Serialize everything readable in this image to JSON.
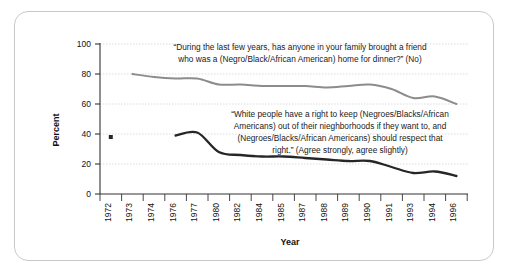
{
  "chart_data": {
    "type": "line",
    "title": "",
    "xlabel": "Year",
    "ylabel": "Percent",
    "ylim": [
      0,
      100
    ],
    "yticks": [
      0,
      20,
      40,
      60,
      80,
      100
    ],
    "grid": true,
    "legend_position": "none",
    "categories": [
      "1972",
      "1973",
      "1974",
      "1976",
      "1977",
      "1980",
      "1982",
      "1984",
      "1985",
      "1987",
      "1988",
      "1989",
      "1990",
      "1991",
      "1993",
      "1994",
      "1996"
    ],
    "series": [
      {
        "name": "During the last few years, has anyone in your family brought a friend who was a (Negro/Black/African American) home for dinner? (No)",
        "color": "#8c8c8c",
        "x": [
          "1973",
          "1974",
          "1976",
          "1977",
          "1980",
          "1982",
          "1984",
          "1985",
          "1987",
          "1988",
          "1989",
          "1990",
          "1991",
          "1993",
          "1994",
          "1996"
        ],
        "values": [
          80,
          78,
          77,
          77,
          73,
          73,
          72,
          72,
          72,
          71,
          72,
          73,
          70,
          64,
          65,
          60
        ]
      },
      {
        "name": "White people have a right to keep (Negroes/Blacks/African Americans) out of their nieghborhoods if they want to, and (Negroes/Blacks/African Americans) should respect that right. (Agree strongly, agree slightly)",
        "color": "#262626",
        "x": [
          "1976",
          "1977",
          "1980",
          "1982",
          "1984",
          "1985",
          "1987",
          "1988",
          "1989",
          "1990",
          "1991",
          "1993",
          "1994",
          "1996"
        ],
        "values": [
          39,
          41,
          28,
          26,
          25,
          25,
          24,
          23,
          22,
          22,
          18,
          14,
          15,
          12
        ],
        "isolated_points": [
          {
            "x": "1972",
            "value": 38,
            "marker": "square"
          }
        ]
      }
    ],
    "annotations": [
      {
        "name": "dinner-question-annotation",
        "lines": [
          "“During the last few years, has anyone in your family brought a friend",
          "who was a (Negro/Black/African American) home for dinner?” (No)"
        ]
      },
      {
        "name": "neighborhood-question-annotation",
        "lines": [
          "“White people have a right to keep (Negroes/Blacks/African",
          "Americans) out of their nieghborhoods if they want to, and",
          "(Negroes/Blacks/African Americans) should respect that",
          "right.” (Agree strongly, agree slightly)"
        ]
      }
    ],
    "colors": {
      "upper_line": "#8c8c8c",
      "lower_line": "#262626",
      "gridline": "#cfcfcf",
      "axis": "#333333",
      "frame_border": "#c9c9c9",
      "background": "#ffffff"
    }
  }
}
